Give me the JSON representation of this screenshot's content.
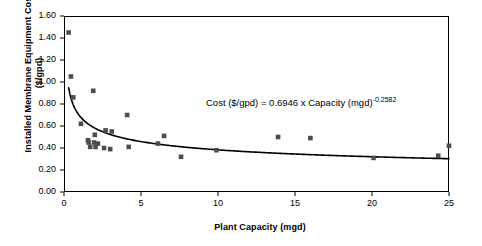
{
  "chart_data": {
    "type": "scatter",
    "title": "",
    "xlabel": "Plant Capacity (mgd)",
    "ylabel": "Installed Membrane Equipment Cost ($/gpd)",
    "xlim": [
      0,
      25
    ],
    "ylim": [
      0,
      1.6
    ],
    "xticks": [
      "0",
      "5",
      "10",
      "15",
      "20",
      "25"
    ],
    "yticks": [
      "0.00",
      "0.20",
      "0.40",
      "0.60",
      "0.80",
      "1.00",
      "1.20",
      "1.40",
      "1.60"
    ],
    "grid": false,
    "legend": null,
    "annotation": {
      "text_plain": "Cost ($/gpd) = 0.6946 x Capacity (mgd)",
      "exponent": "-0.2582"
    },
    "series": [
      {
        "name": "Installed membrane equipment cost data",
        "marker": "square",
        "color": "#4d4d4d",
        "points": [
          [
            0.3,
            1.45
          ],
          [
            0.45,
            1.05
          ],
          [
            0.6,
            0.86
          ],
          [
            1.1,
            0.62
          ],
          [
            1.55,
            0.47
          ],
          [
            1.6,
            0.45
          ],
          [
            1.7,
            0.41
          ],
          [
            1.9,
            0.92
          ],
          [
            1.95,
            0.45
          ],
          [
            2.0,
            0.52
          ],
          [
            2.05,
            0.41
          ],
          [
            2.2,
            0.44
          ],
          [
            2.6,
            0.4
          ],
          [
            2.7,
            0.56
          ],
          [
            3.0,
            0.39
          ],
          [
            3.1,
            0.55
          ],
          [
            4.1,
            0.7
          ],
          [
            4.2,
            0.41
          ],
          [
            6.1,
            0.44
          ],
          [
            6.5,
            0.51
          ],
          [
            7.6,
            0.32
          ],
          [
            9.9,
            0.38
          ],
          [
            13.9,
            0.5
          ],
          [
            16.0,
            0.49
          ],
          [
            20.1,
            0.31
          ],
          [
            24.3,
            0.33
          ],
          [
            25.0,
            0.42
          ]
        ]
      }
    ],
    "fit_curve": {
      "type": "power",
      "coefficient": 0.6946,
      "exponent": -0.2582,
      "color": "#000000"
    }
  }
}
